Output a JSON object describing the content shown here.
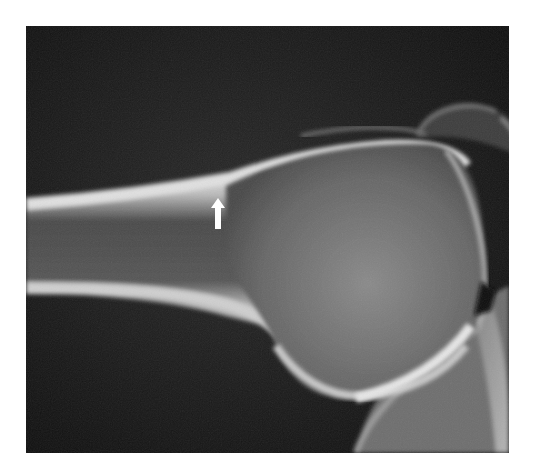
{
  "figure": {
    "type": "radiograph",
    "background_color": "#141414",
    "page_background": "#ffffff",
    "annotations": [
      {
        "type": "arrow",
        "direction": "up",
        "color": "#ffffff",
        "x": 218,
        "y_tip": 200,
        "y_tail": 229
      }
    ]
  }
}
